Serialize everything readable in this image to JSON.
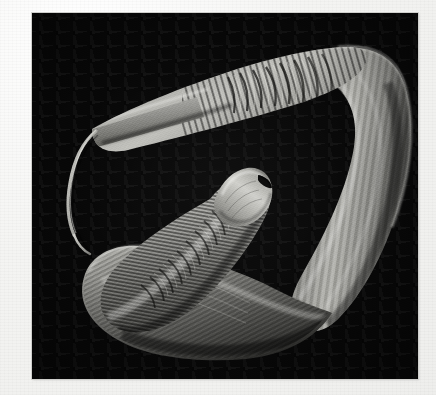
{
  "page": {
    "background_color": "#f3f3f1",
    "caption": ""
  },
  "micrograph": {
    "name": "nematode-sem-micrograph",
    "modality": "scanning-electron-micrograph",
    "background_color": "#090909",
    "frame": {
      "x": 32,
      "y": 13,
      "width": 386,
      "height": 366
    },
    "specimen": {
      "label": "nematode-worm",
      "description": "Coiled nematode with tapering whip-like tail, annulated anterior region and blunt rounded head bearing a dark mouth opening",
      "tone_highlight": "#c9c9c5",
      "tone_midtone": "#8e8e8a",
      "tone_shadow": "#3a3a38"
    },
    "features": [
      {
        "name": "head-tip",
        "label": "blunt rounded anterior head"
      },
      {
        "name": "mouth-opening",
        "label": "dark oral aperture"
      },
      {
        "name": "annulations",
        "label": "transverse cuticular rings"
      },
      {
        "name": "tail-filament",
        "label": "thin whip-like posterior filament"
      },
      {
        "name": "body-coil",
        "label": "looped body"
      }
    ]
  }
}
